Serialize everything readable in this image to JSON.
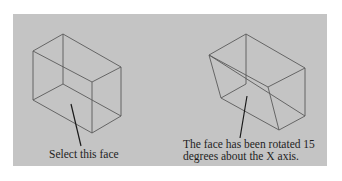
{
  "figure": {
    "left": {
      "caption": "Select this face"
    },
    "right": {
      "caption_line1": "The face has been rotated 15",
      "caption_line2": "degrees about the X axis."
    }
  },
  "colors": {
    "panel": "#c4c4c4",
    "edge": "#5a5a5a",
    "leader": "#1a1a1a",
    "text": "#1e1e1e"
  }
}
